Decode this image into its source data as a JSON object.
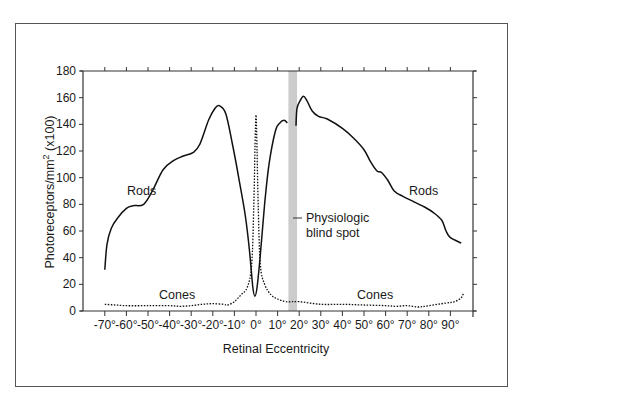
{
  "chart_data": {
    "type": "line",
    "title": "",
    "xlabel": "Retinal Eccentricity",
    "ylabel": "Photoreceptors/mm² (x100)",
    "ylabel_parts": {
      "main": "Photoreceptors/mm",
      "sup": "2",
      "suffix": " (x100)"
    },
    "ylim": [
      0,
      180
    ],
    "xlim": [
      -80,
      100
    ],
    "grid": false,
    "legend": "none (inline labels)",
    "yticks": [
      0,
      20,
      40,
      60,
      80,
      100,
      120,
      140,
      160,
      180
    ],
    "xticks": [
      "-70°",
      "-60°",
      "-50°",
      "-40°",
      "-30°",
      "-20°",
      "-10°",
      "0°",
      "10°",
      "20°",
      "30°",
      "40°",
      "50°",
      "60°",
      "70°",
      "80°",
      "90°"
    ],
    "xtick_values": [
      -70,
      -60,
      -50,
      -40,
      -30,
      -20,
      -10,
      0,
      10,
      20,
      30,
      40,
      50,
      60,
      70,
      80,
      90
    ],
    "series": [
      {
        "name": "Rods",
        "style": "solid",
        "segments": [
          {
            "x": [
              -70,
              -69,
              -67,
              -64,
              -60,
              -57,
              -52,
              -48,
              -43,
              -38,
              -34,
              -29,
              -26,
              -22,
              -19,
              -17,
              -14,
              -11,
              -8,
              -5,
              -3,
              -1.5,
              -0.5,
              0.5,
              2,
              4,
              6,
              9,
              11,
              13,
              14.5
            ],
            "y": [
              31,
              50,
              62,
              70,
              77,
              79,
              80,
              90,
              106,
              113,
              116,
              119,
              125,
              143,
              152,
              154,
              148,
              126,
              100,
              72,
              45,
              18,
              11,
              18,
              42,
              80,
              110,
              135,
              141,
              143,
              141
            ]
          },
          {
            "x": [
              18.5,
              19,
              20.5,
              22,
              23.5,
              26,
              29,
              33,
              40,
              45,
              50,
              53,
              56,
              58,
              61,
              64,
              68,
              73,
              78,
              82,
              86,
              88,
              90,
              95
            ],
            "y": [
              139,
              152,
              158,
              161,
              158,
              150,
              146,
              144,
              137,
              130,
              121,
              112,
              105,
              104,
              98,
              90,
              86,
              82,
              78,
              74,
              68,
              60,
              55,
              51
            ]
          }
        ]
      },
      {
        "name": "Cones",
        "style": "dotted",
        "x": [
          -70,
          -65,
          -60,
          -50,
          -40,
          -35,
          -30,
          -25,
          -20,
          -15,
          -13,
          -10,
          -7,
          -4,
          -2,
          -1,
          -0.5,
          0,
          0.5,
          1,
          2,
          4,
          7,
          10,
          14,
          20,
          30,
          40,
          50,
          60,
          65,
          70,
          75,
          80,
          88,
          92,
          95,
          96
        ],
        "y": [
          5,
          4.5,
          4,
          4,
          4,
          3.5,
          4,
          5,
          5.5,
          5,
          4.5,
          7,
          12,
          18,
          35,
          80,
          120,
          147,
          120,
          80,
          35,
          20,
          12,
          9,
          7,
          7,
          5,
          5,
          4.5,
          4,
          3.5,
          4,
          3,
          4,
          6,
          7,
          10,
          13
        ]
      }
    ],
    "annotations": [
      {
        "text": "Rods",
        "x": -52,
        "y": 90
      },
      {
        "text": "Rods",
        "x": 77,
        "y": 90
      },
      {
        "text": "Cones",
        "x": -40,
        "y": 11
      },
      {
        "text": "Cones",
        "x": 52,
        "y": 11
      },
      {
        "text": "Physiologic blind spot",
        "lines": [
          "Physiologic",
          "blind spot"
        ],
        "band_x": [
          15,
          19
        ],
        "pointer_y": 70
      }
    ]
  },
  "labels": {
    "ylabel_main": "Photoreceptors/mm",
    "ylabel_sup": "2",
    "ylabel_suffix": " (x100)",
    "xlabel": "Retinal Eccentricity",
    "rods_left": "Rods",
    "rods_right": "Rods",
    "cones_left": "Cones",
    "cones_right": "Cones",
    "blind_spot_line1": "Physiologic",
    "blind_spot_line2": "blind spot"
  },
  "colors": {
    "line": "#111111",
    "axis": "#333333",
    "blind_spot_band": "#cccccc",
    "frame": "#555555"
  }
}
